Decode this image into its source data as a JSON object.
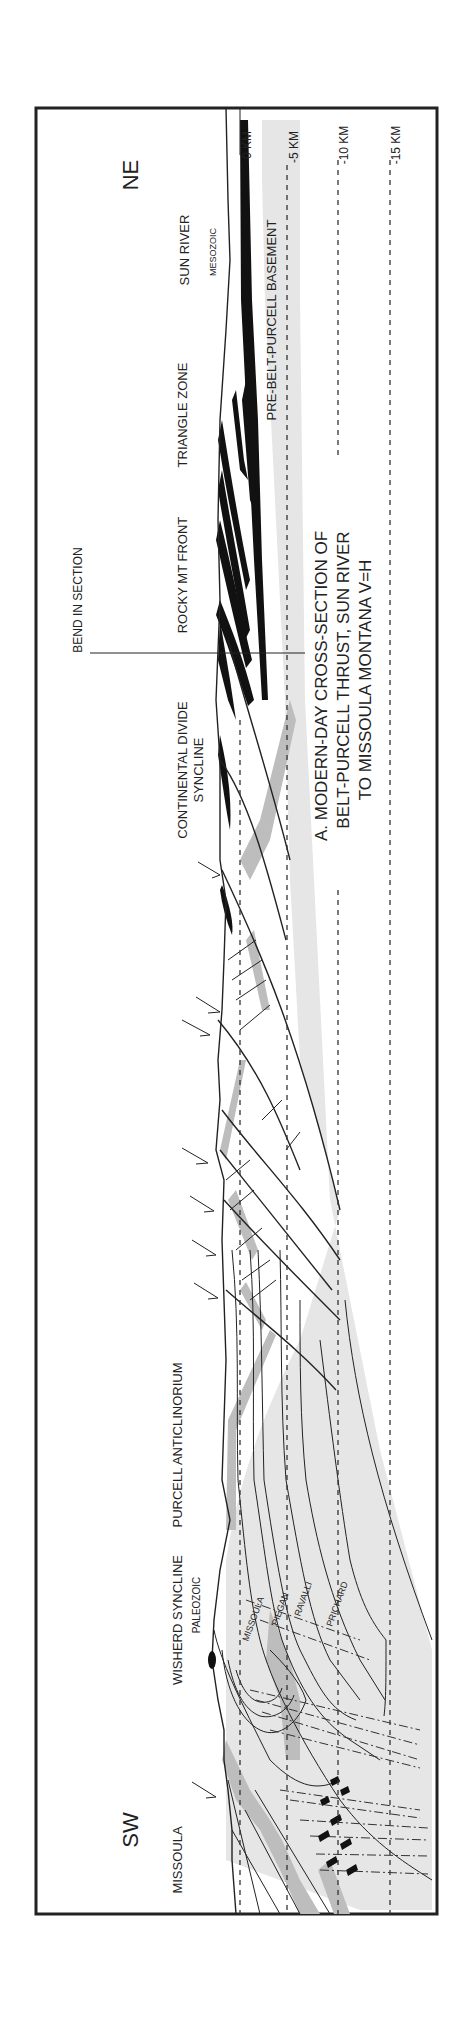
{
  "figure": {
    "title_lines": [
      "A.  MODERN-DAY CROSS-SECTION OF",
      "BELT-PURCELL THRUST, SUN RIVER",
      "TO MISSOULA MONTANA  V=H"
    ],
    "orientation": {
      "sw": "SW",
      "ne": "NE"
    },
    "depth_scale": {
      "labels": [
        "0 KM",
        "-5 KM",
        "-10 KM",
        "-15 KM"
      ],
      "values_km": [
        0,
        -5,
        -10,
        -15
      ]
    },
    "locality_labels": [
      "MISSOULA",
      "WISHERD SYNCLINE",
      "PURCELL ANTICLINORIUM",
      "CONTINENTAL DIVIDE",
      "SYNCLINE",
      "ROCKY MT FRONT",
      "TRIANGLE ZONE",
      "SUN RIVER"
    ],
    "unit_labels": {
      "paleozoic": "PALEOZOIC",
      "mesozoic": "MESOZOIC",
      "basement": "PRE-BELT-PURCELL BASEMENT",
      "missoula": "MISSOULA",
      "piegan": "PIEGAN",
      "ravalli": "RAVALLI",
      "prichard": "PRICHARD"
    },
    "bend_label": "BEND IN SECTION",
    "colors": {
      "frame": "#222222",
      "dark_gray_unit": "#bdbdbd",
      "light_gray_unit": "#e6e6e6",
      "black_unit": "#111111"
    }
  }
}
